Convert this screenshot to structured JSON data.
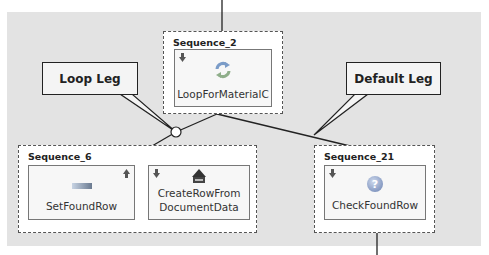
{
  "diagram": {
    "sequences": [
      {
        "id": "seq2",
        "title": "Sequence_2",
        "steps": [
          {
            "label": "LoopForMaterialC",
            "icon": "loop-icon",
            "indicator": "down-arrow"
          }
        ]
      },
      {
        "id": "seq6",
        "title": "Sequence_6",
        "steps": [
          {
            "label": "SetFoundRow",
            "icon": "container-operation-icon",
            "indicator": "up-arrow"
          },
          {
            "label_line1": "CreateRowFrom",
            "label_line2": "DocumentData",
            "icon": "create-row-icon",
            "indicator": "down-arrow"
          }
        ]
      },
      {
        "id": "seq21",
        "title": "Sequence_21",
        "steps": [
          {
            "label": "CheckFoundRow",
            "icon": "question-icon",
            "indicator": "down-arrow"
          }
        ]
      }
    ],
    "callouts": {
      "loop_leg": "Loop Leg",
      "default_leg": "Default Leg"
    },
    "colors": {
      "canvas": "#e3e3e3",
      "line": "#222222",
      "question_icon": "#8aa0c8",
      "loop_icon": "#6b8fbf"
    }
  }
}
